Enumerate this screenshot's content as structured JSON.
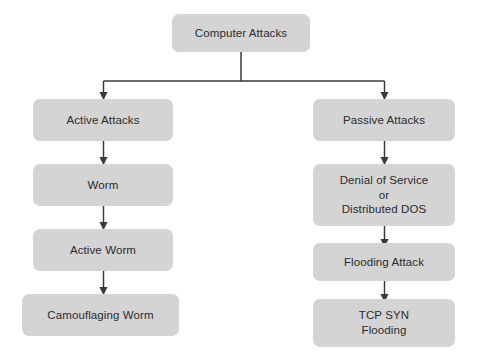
{
  "diagram": {
    "background_color": "#ffffff",
    "node_fill_color": "#d4d4d4",
    "text_color": "#2b2b2b",
    "connector_color": "#3a3a3a",
    "nodes": {
      "root": {
        "lines": [
          "Computer Attacks"
        ]
      },
      "active_attacks": {
        "lines": [
          "Active Attacks"
        ]
      },
      "worm": {
        "lines": [
          "Worm"
        ]
      },
      "active_worm": {
        "lines": [
          "Active Worm"
        ]
      },
      "camouflaging_worm": {
        "lines": [
          "Camouflaging Worm"
        ]
      },
      "passive_attacks": {
        "lines": [
          "Passive Attacks"
        ]
      },
      "denial_of_service": {
        "lines": [
          "Denial of Service",
          "or",
          "Distributed DOS"
        ]
      },
      "flooding_attack": {
        "lines": [
          "Flooding Attack"
        ]
      },
      "tcp_syn_flooding": {
        "lines": [
          "TCP SYN",
          "Flooding"
        ]
      }
    }
  }
}
